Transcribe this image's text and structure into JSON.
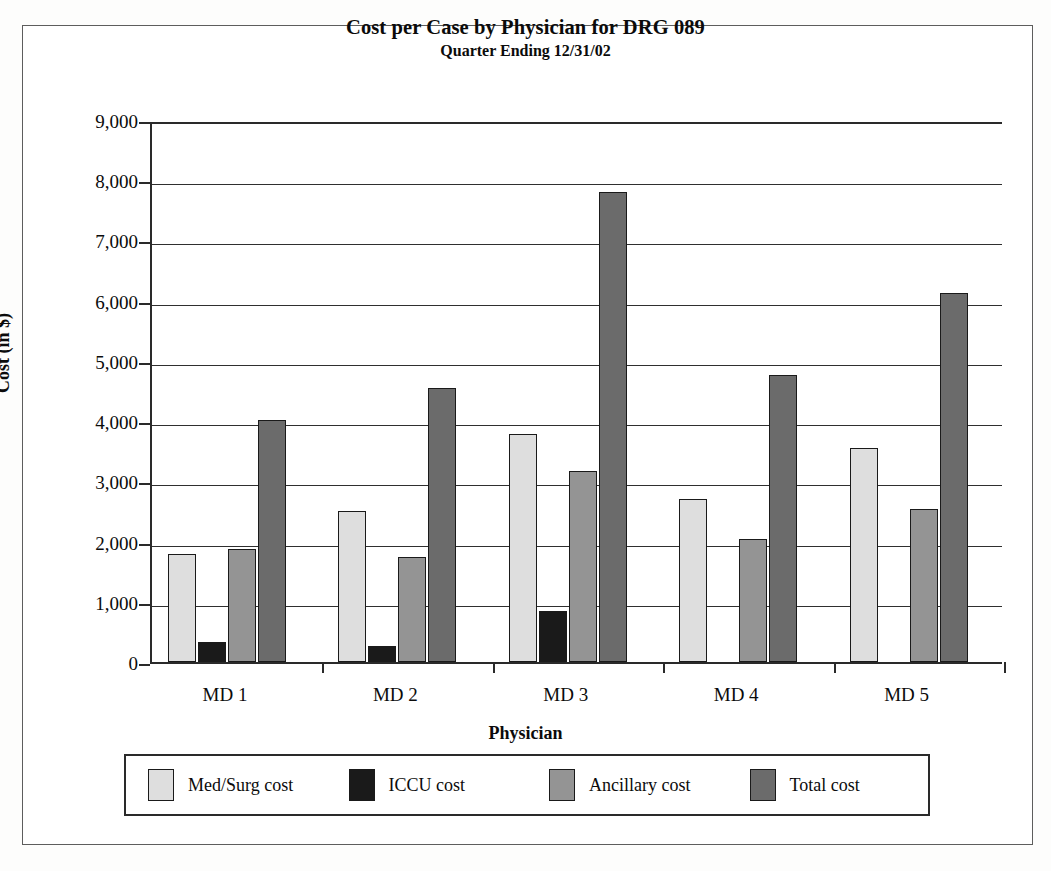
{
  "chart_data": {
    "type": "bar",
    "title": "Cost per Case by Physician for DRG 089",
    "subtitle": "Quarter Ending 12/31/02",
    "xlabel": "Physician",
    "ylabel": "Cost (in $)",
    "ylim": [
      0,
      9000
    ],
    "ytick_step": 1000,
    "grid": true,
    "legend_position": "bottom",
    "categories": [
      "MD 1",
      "MD 2",
      "MD 3",
      "MD 4",
      "MD 5"
    ],
    "ytick_labels": [
      "0",
      "1,000",
      "2,000",
      "3,000",
      "4,000",
      "5,000",
      "6,000",
      "7,000",
      "8,000",
      "9,000"
    ],
    "series": [
      {
        "name": "Med/Surg cost",
        "color": "#dedede",
        "values": [
          1800,
          2500,
          3780,
          2700,
          3560
        ]
      },
      {
        "name": "ICCU cost",
        "color": "#1a1a1a",
        "values": [
          340,
          270,
          850,
          0,
          0
        ]
      },
      {
        "name": "Ancillary cost",
        "color": "#949494",
        "values": [
          1870,
          1750,
          3170,
          2040,
          2540
        ]
      },
      {
        "name": "Total cost",
        "color": "#6b6b6b",
        "values": [
          4020,
          4550,
          7800,
          4760,
          6120
        ]
      }
    ]
  },
  "legend": {
    "items": [
      {
        "label": "Med/Surg cost"
      },
      {
        "label": "ICCU cost"
      },
      {
        "label": "Ancillary cost"
      },
      {
        "label": "Total cost"
      }
    ]
  }
}
